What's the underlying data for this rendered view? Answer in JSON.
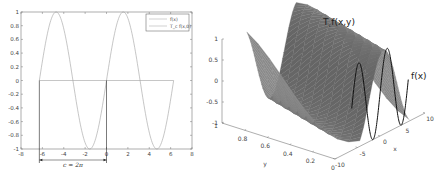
{
  "chart_data": [
    {
      "type": "line",
      "title": "",
      "xlabel": "",
      "ylabel": "",
      "xlim": [
        -8,
        8
      ],
      "ylim": [
        -1,
        1
      ],
      "xticks": [
        "-8",
        "-6",
        "-4",
        "-2",
        "0",
        "2",
        "4",
        "6",
        "8"
      ],
      "yticks": [
        "-1",
        "-0.8",
        "-0.6",
        "-0.4",
        "-0.2",
        "0",
        "0.2",
        "0.4",
        "0.6",
        "0.8",
        "1"
      ],
      "grid": false,
      "legend_position": "top-right",
      "series": [
        {
          "name": "f(x)",
          "function": "sin(x)",
          "x_range": [
            -6.283,
            6.283
          ],
          "color": "#999999"
        },
        {
          "name": "T_c f(x,0)",
          "function": "0",
          "x_range": [
            -6.283,
            6.283
          ],
          "color": "#999999"
        }
      ],
      "annotations": [
        {
          "text": "c = 2π",
          "type": "interval-arrow",
          "x_from": -6.283,
          "x_to": 0
        },
        {
          "type": "vertical-line",
          "x": -6.283,
          "y_from": -1,
          "y_to": 0
        },
        {
          "type": "vertical-line",
          "x": 0,
          "y_from": -1,
          "y_to": 0
        }
      ]
    },
    {
      "type": "surface",
      "title": "T_c f(x,y)",
      "title_main": "T",
      "title_sub": "c",
      "title_rest": "f(x,y)",
      "xlabel": "x",
      "ylabel": "y",
      "zlabel": "",
      "xlim": [
        -10,
        10
      ],
      "ylim": [
        0,
        1
      ],
      "zlim": [
        -1,
        1
      ],
      "xticks": [
        "-10",
        "-5",
        "0",
        "5",
        "10"
      ],
      "yticks": [
        "0",
        "0.2",
        "0.4",
        "0.6",
        "0.8",
        "1"
      ],
      "zticks": [
        "-1",
        "-0.5",
        "0",
        "0.5",
        "1"
      ],
      "surface_function": "sin(x + 2*pi*y)",
      "curve": {
        "name": "f(x)",
        "function": "sin(x)",
        "at_y": 0,
        "x_range": [
          -6.283,
          6.283
        ],
        "color": "#111111"
      },
      "surface_color": "#6e6e6e"
    }
  ]
}
